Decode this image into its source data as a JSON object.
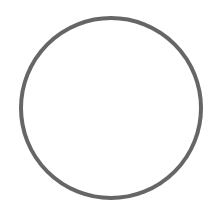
{
  "shape": {
    "type": "circle-outline",
    "cx": 111,
    "cy": 108,
    "r": 90,
    "stroke_width": 4,
    "stroke_color": "#666666",
    "fill": "#ffffff"
  },
  "background": "#ffffff"
}
